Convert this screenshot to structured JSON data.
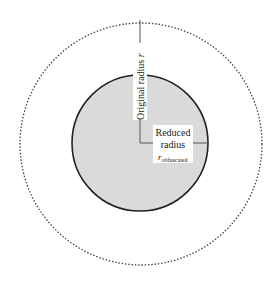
{
  "diagram": {
    "outer_circle": {
      "label": "Original radius",
      "symbol": "r",
      "style": "dotted",
      "stroke": "#444444"
    },
    "inner_circle": {
      "label_line1": "Reduced",
      "label_line2": "radius",
      "symbol": "r",
      "subscript": "obfuscated",
      "fill": "#d9d9d9",
      "stroke": "#222222"
    }
  }
}
